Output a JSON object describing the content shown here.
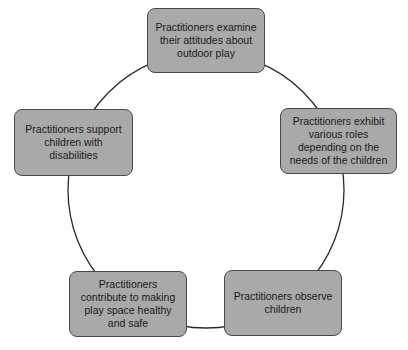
{
  "diagram": {
    "type": "cycle",
    "colors": {
      "node_fill": "#a9a9a9",
      "node_border": "#4a4a4a",
      "line": "#2a2a2a",
      "text": "#1a1a1a"
    },
    "nodes": [
      {
        "id": "top",
        "label": "Practitioners examine their attitudes about outdoor play"
      },
      {
        "id": "right",
        "label": "Practitioners exhibit various roles depending on the needs of the children"
      },
      {
        "id": "bottom-right",
        "label": "Practitioners observe children"
      },
      {
        "id": "bottom-left",
        "label": "Practitioners contribute to making play space healthy and safe"
      },
      {
        "id": "left",
        "label": "Practitioners support children with disabilities"
      }
    ]
  }
}
